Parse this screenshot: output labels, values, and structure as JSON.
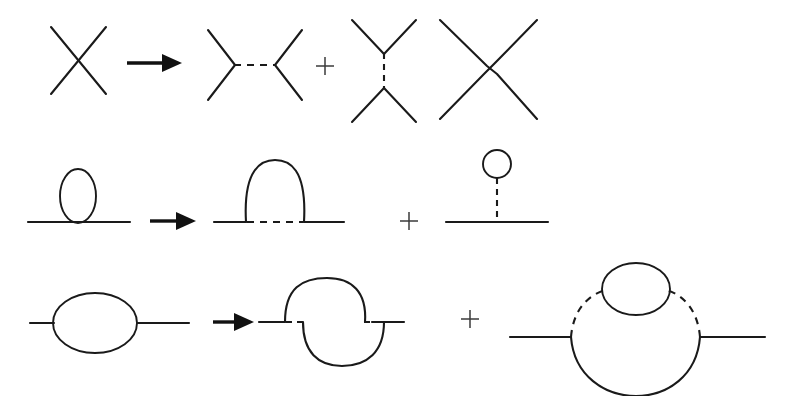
{
  "figure": {
    "title": "Perturbative expansion of Feynman diagrams",
    "width": 790,
    "height": 396,
    "background_color": "#ffffff",
    "line_color": "#1a1a1a",
    "plus_color": "#3a3a3a"
  },
  "rows": [
    {
      "id": "row-contact-vertex",
      "label": "Four-point contact interaction expansion",
      "operator_labels": [
        "→",
        "+"
      ],
      "terms": [
        {
          "id": "contact-x-vertex",
          "label": "Four-leg contact vertex (X)",
          "kind": "contact-vertex"
        },
        {
          "id": "s-channel-exchange",
          "label": "s-channel exchange with horizontal dashed propagator",
          "kind": "s-channel"
        },
        {
          "id": "t-channel-exchange",
          "label": "t-channel exchange with vertical dashed propagator",
          "kind": "t-channel"
        },
        {
          "id": "crossed-exchange",
          "label": "Crossed (u-channel) exchange diagram",
          "kind": "u-channel"
        }
      ]
    },
    {
      "id": "row-tadpole",
      "label": "Tadpole expansion",
      "operator_labels": [
        "→",
        "+"
      ],
      "terms": [
        {
          "id": "tadpole-loop",
          "label": "Vertical loop sitting on a propagator line",
          "kind": "tadpole-loop"
        },
        {
          "id": "arch-loop",
          "label": "Arch loop over a dashed propagator segment",
          "kind": "arch-loop"
        },
        {
          "id": "circle-stem-tadpole",
          "label": "Circle loop attached by vertical dashed stem to the line",
          "kind": "circle-stem"
        }
      ]
    },
    {
      "id": "row-self-energy",
      "label": "Self-energy bubble expansion",
      "operator_labels": [
        "→",
        "+"
      ],
      "terms": [
        {
          "id": "bubble-self-energy",
          "label": "One-loop self-energy bubble on a propagator line",
          "kind": "bubble"
        },
        {
          "id": "crossed-arcs",
          "label": "Two offset crossing arcs with dashed line segments",
          "kind": "crossed-arcs"
        },
        {
          "id": "nested-loop",
          "label": "Large loop with dashed upper arcs and nested small circle",
          "kind": "nested-loop"
        }
      ]
    }
  ],
  "symbols": {
    "arrow": "arrow-right",
    "plus": "+"
  }
}
